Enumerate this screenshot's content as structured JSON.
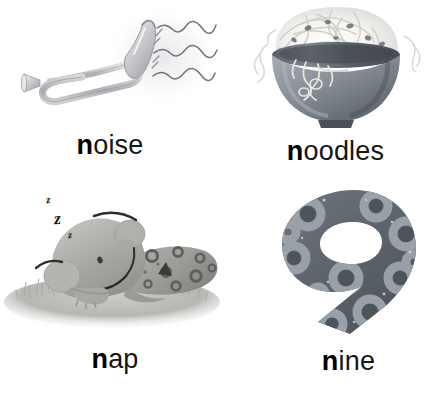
{
  "page": {
    "background_color": "#ffffff",
    "width": 439,
    "height": 393,
    "kind": "alphabet-flashcard-page",
    "letter_focus": "n"
  },
  "cells": [
    {
      "id": "noise",
      "word": "noise",
      "lead_letter": "n",
      "rest_letters": "oise",
      "illustration": "bugle-trumpet-with-sound-waves",
      "colors": {
        "instrument_light": "#e8e8ea",
        "instrument_mid": "#c2c3c7",
        "instrument_dark": "#9b9ca1",
        "outline": "#8d8e93",
        "wave_line": "#6f7075",
        "halo": "#f0f0f2"
      },
      "wave_count": 3
    },
    {
      "id": "noodles",
      "word": "noodles",
      "lead_letter": "n",
      "rest_letters": "oodles",
      "illustration": "bowl-of-noodles",
      "colors": {
        "bowl_light": "#9aa0a8",
        "bowl_mid": "#80878f",
        "bowl_dark": "#5d646c",
        "bowl_rim": "#4e545b",
        "noodle_light": "#fbfbfa",
        "noodle_shade": "#dcdcda",
        "noodle_gap": "#4c4c4c"
      }
    },
    {
      "id": "nap",
      "word": "nap",
      "lead_letter": "n",
      "rest_letters": "ap",
      "illustration": "sleeping-spotted-dinosaur-on-grass",
      "sleep_marks": [
        "z",
        "z",
        "z"
      ],
      "colors": {
        "body_light": "#b8b8b4",
        "body_mid": "#a2a29e",
        "body_dark": "#8c8c88",
        "spot": "#6a6a66",
        "line": "#2e2e2e",
        "grass_light": "#cfcfcb",
        "grass_mid": "#b0b0ac",
        "grass_dark": "#94948f"
      }
    },
    {
      "id": "nine",
      "word": "nine",
      "lead_letter": "n",
      "rest_letters": "ine",
      "illustration": "numeral-nine-with-ring-spots",
      "numeral": "9",
      "colors": {
        "numeral_fill": "#5d646c",
        "numeral_fill_dark": "#4d545c",
        "ring": "#9aa1a8",
        "ring_hole": "#5d646c",
        "speck": "#d8dade"
      }
    }
  ]
}
